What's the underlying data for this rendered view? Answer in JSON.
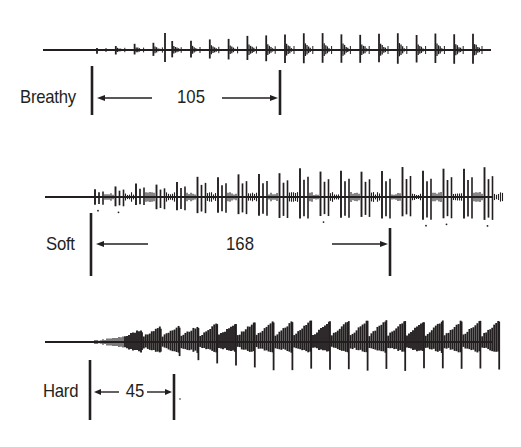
{
  "figure": {
    "type": "voice onset waveform comparison",
    "ink_color": "#231f20",
    "background": "#ffffff"
  },
  "rows": [
    {
      "label": "Breathy",
      "duration_value": "105",
      "baseline_y": 50,
      "onset_x": 97,
      "marker_start_x": 92,
      "marker_end_x": 280,
      "label_y": 98,
      "waveform_style": "sparse-spikes"
    },
    {
      "label": "Soft",
      "duration_value": "168",
      "baseline_y": 197,
      "onset_x": 95,
      "marker_start_x": 91,
      "marker_end_x": 390,
      "label_y": 248,
      "waveform_style": "irregular-spikes"
    },
    {
      "label": "Hard",
      "duration_value": "45",
      "baseline_y": 342,
      "onset_x": 95,
      "marker_start_x": 90,
      "marker_end_x": 174,
      "label_y": 393,
      "waveform_style": "dense-sawtooth"
    }
  ]
}
